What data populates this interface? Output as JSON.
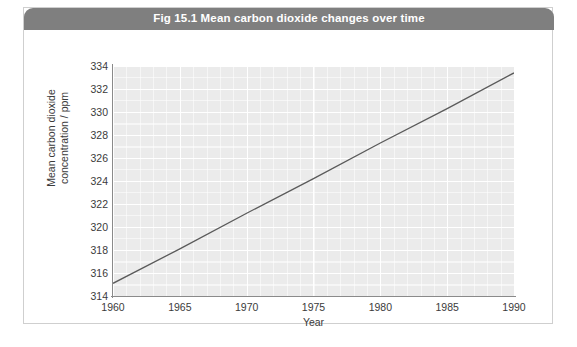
{
  "figure": {
    "title": "Fig 15.1 Mean carbon dioxide changes over time",
    "banner_color": "#7f7f7f",
    "card_border_color": "#cfcfcf",
    "card_background": "#ffffff"
  },
  "chart_data": {
    "type": "line",
    "title": "Fig 15.1 Mean carbon dioxide changes over time",
    "xlabel": "Year",
    "ylabel": "Mean carbon dioxide\nconcentration / ppm",
    "ylabel_line1": "Mean carbon dioxide",
    "ylabel_line2": "concentration / ppm",
    "xlim": [
      1960,
      1990
    ],
    "ylim": [
      314,
      334
    ],
    "xticks": [
      1960,
      1965,
      1970,
      1975,
      1980,
      1985,
      1990
    ],
    "yticks": [
      314,
      316,
      318,
      320,
      322,
      324,
      326,
      328,
      330,
      332,
      334
    ],
    "grid": true,
    "grid_major_color": "#ffffff",
    "grid_minor_color": "#f4f4f4",
    "plot_background": "#ebebeb",
    "legend": null,
    "series": [
      {
        "name": "Mean carbon dioxide concentration",
        "color": "#5a5a5a",
        "line_width": 1.3,
        "x": [
          1960,
          1965,
          1970,
          1975,
          1980,
          1985,
          1990
        ],
        "values": [
          315.1,
          318.1,
          321.2,
          324.2,
          327.3,
          330.3,
          333.4
        ]
      }
    ]
  }
}
